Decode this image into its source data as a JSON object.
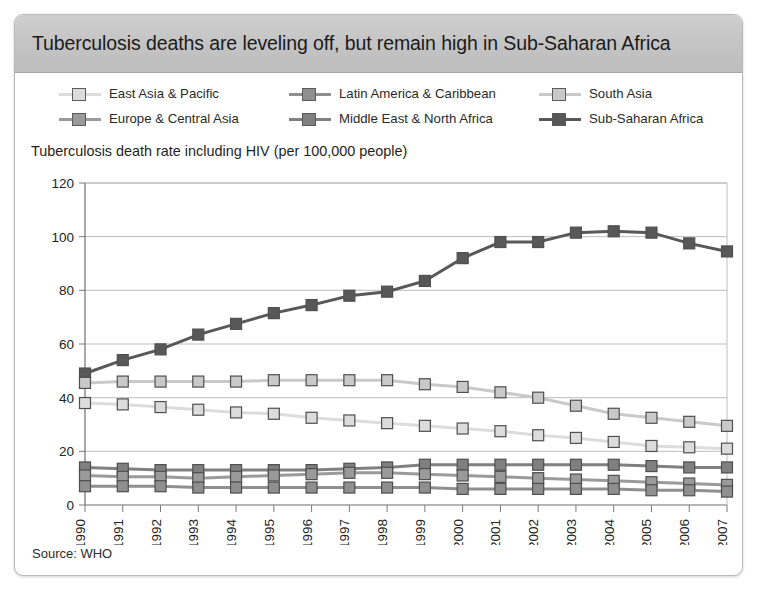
{
  "header": {
    "title": "Tuberculosis deaths are leveling off, but remain high in Sub-Saharan Africa"
  },
  "axis_label": "Tuberculosis death rate including HIV (per 100,000 people)",
  "source": "Source: WHO",
  "legend": {
    "position": "top",
    "entries": [
      {
        "label": "East Asia & Pacific",
        "color": "#dcdcdc"
      },
      {
        "label": "Latin America & Caribbean",
        "color": "#8f8f8f"
      },
      {
        "label": "South Asia",
        "color": "#c9c9c9"
      },
      {
        "label": "Europe & Central Asia",
        "color": "#9a9a9a"
      },
      {
        "label": "Middle East & North Africa",
        "color": "#808080"
      },
      {
        "label": "Sub-Saharan Africa",
        "color": "#585858"
      }
    ]
  },
  "chart_data": {
    "type": "line",
    "title": "Tuberculosis deaths are leveling off, but remain high in Sub-Saharan Africa",
    "xlabel": "",
    "ylabel": "Tuberculosis death rate including HIV (per 100,000 people)",
    "ylim": [
      0,
      120
    ],
    "ytick_step": 20,
    "yticks": [
      0,
      20,
      40,
      60,
      80,
      100,
      120
    ],
    "grid": true,
    "categories": [
      "1990",
      "1991",
      "1992",
      "1993",
      "1994",
      "1995",
      "1996",
      "1997",
      "1998",
      "1999",
      "2000",
      "2001",
      "2002",
      "2003",
      "2004",
      "2005",
      "2006",
      "2007"
    ],
    "series": [
      {
        "name": "Sub-Saharan Africa",
        "color": "#585858",
        "values": [
          49,
          54,
          58,
          63.5,
          67.5,
          71.5,
          74.5,
          78,
          79.5,
          83.5,
          92,
          98,
          98,
          101.5,
          102,
          101.5,
          97.5,
          94.5
        ]
      },
      {
        "name": "South Asia",
        "color": "#c9c9c9",
        "values": [
          45.5,
          46,
          46,
          46,
          46,
          46.5,
          46.5,
          46.5,
          46.5,
          45,
          44,
          42,
          40,
          37,
          34,
          32.5,
          31,
          29.5
        ]
      },
      {
        "name": "East Asia & Pacific",
        "color": "#dcdcdc",
        "values": [
          38,
          37.5,
          36.5,
          35.5,
          34.5,
          34,
          32.5,
          31.5,
          30.5,
          29.5,
          28.5,
          27.5,
          26,
          25,
          23.5,
          22,
          21.5,
          21
        ]
      },
      {
        "name": "Middle East & North Africa",
        "color": "#808080",
        "values": [
          14,
          13.5,
          13,
          13,
          13,
          13,
          13,
          13.5,
          14,
          15,
          15,
          15,
          15,
          15,
          15,
          14.5,
          14,
          14
        ]
      },
      {
        "name": "Europe & Central Asia",
        "color": "#9a9a9a",
        "values": [
          11,
          10.5,
          10.5,
          10,
          10.5,
          11,
          11.5,
          12,
          12,
          11.5,
          11,
          10.5,
          10,
          9.5,
          9,
          8.5,
          8,
          7.5
        ]
      },
      {
        "name": "Latin America & Caribbean",
        "color": "#8f8f8f",
        "values": [
          7,
          7,
          7,
          6.5,
          6.5,
          6.5,
          6.5,
          6.5,
          6.5,
          6.5,
          6,
          6,
          6,
          6,
          6,
          5.5,
          5.5,
          5
        ]
      }
    ]
  }
}
